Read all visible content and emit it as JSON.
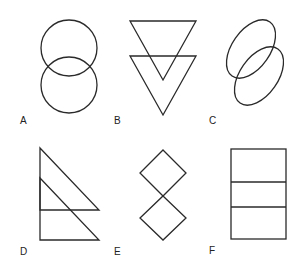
{
  "figures": [
    {
      "label": "A",
      "description": "two vertically overlapping circles"
    },
    {
      "label": "B",
      "description": "two vertically overlapping inverted triangles"
    },
    {
      "label": "C",
      "description": "two overlapping tilted ellipses"
    },
    {
      "label": "D",
      "description": "two overlapping right triangles"
    },
    {
      "label": "E",
      "description": "two diamonds touching at a point"
    },
    {
      "label": "F",
      "description": "rectangle divided into three horizontal sections"
    }
  ]
}
